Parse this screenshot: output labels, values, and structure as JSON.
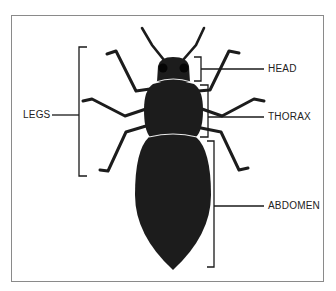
{
  "diagram": {
    "labels": {
      "head": "HEAD",
      "thorax": "THORAX",
      "abdomen": "ABDOMEN",
      "legs": "LEGS"
    },
    "colors": {
      "body": "#1c1c1c",
      "segment_line": "#e8e8e8",
      "bracket": "#1a1a1a",
      "frame": "#8a8a8a",
      "text": "#222222"
    }
  }
}
